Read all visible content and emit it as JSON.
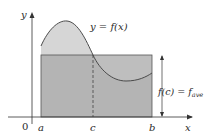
{
  "diagram": {
    "curve_label": "y = f(x)",
    "rect_label": "f(c) = f",
    "rect_label_sub": "ave",
    "axis_x_label": "x",
    "axis_y_label": "y",
    "origin_label": "0",
    "tick_labels": [
      "a",
      "c",
      "b"
    ],
    "colors": {
      "area_under_curve": "#d4d4d4",
      "rectangle": "#a9a9a9",
      "axis": "#333333",
      "curve": "#555555"
    }
  }
}
